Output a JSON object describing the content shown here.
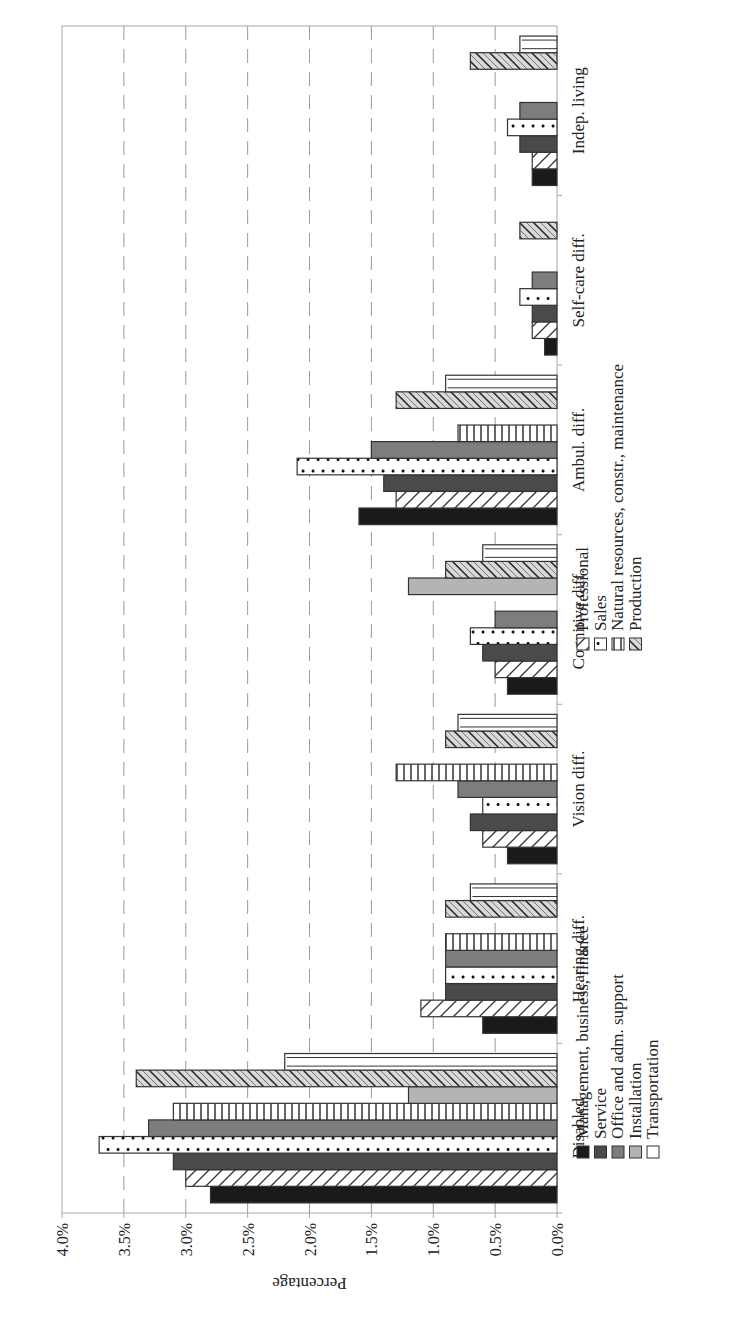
{
  "chart_data": {
    "type": "bar",
    "orientation": "vertical bars (page rotated 90° counter-clockwise)",
    "title": "",
    "xlabel": "",
    "ylabel": "Percentage",
    "ylim": [
      0,
      4.0
    ],
    "yticks": [
      "0.0%",
      "0.5%",
      "1.0%",
      "1.5%",
      "2.0%",
      "2.5%",
      "3.0%",
      "3.5%",
      "4.0%"
    ],
    "grid": "horizontal dashed at every 0.5%",
    "legend_position": "below plot, two columns",
    "categories": [
      "Disabled",
      "Hearing diff.",
      "Vision diff.",
      "Cognitive diff.",
      "Ambul. diff.",
      "Self-care diff.",
      "Indep. living"
    ],
    "series": [
      {
        "name": "Management, business, finance",
        "pattern": "solid-black",
        "values": [
          2.8,
          0.6,
          0.4,
          0.4,
          1.6,
          0.1,
          0.2
        ]
      },
      {
        "name": "Professional",
        "pattern": "diagonal-back-hatch",
        "values": [
          3.0,
          1.1,
          0.6,
          0.5,
          1.3,
          0.2,
          0.2
        ]
      },
      {
        "name": "Service",
        "pattern": "solid-dark-gray",
        "values": [
          3.1,
          0.9,
          0.7,
          0.6,
          1.4,
          0.2,
          0.3
        ]
      },
      {
        "name": "Sales",
        "pattern": "dots",
        "values": [
          3.7,
          0.9,
          0.6,
          0.7,
          2.1,
          0.3,
          0.4
        ]
      },
      {
        "name": "Office and adm. support",
        "pattern": "solid-mid-gray",
        "values": [
          3.3,
          0.9,
          0.8,
          0.5,
          1.5,
          0.2,
          0.3
        ]
      },
      {
        "name": "Natural resources, constr., maintenance",
        "pattern": "vertical-stripes",
        "values": [
          3.1,
          0.9,
          1.3,
          0,
          0.8,
          0,
          0
        ]
      },
      {
        "name": "Installation",
        "pattern": "solid-light-gray",
        "values": [
          1.2,
          0,
          0,
          1.2,
          0,
          0,
          0
        ]
      },
      {
        "name": "Production",
        "pattern": "dense-forward-hatch",
        "values": [
          3.4,
          0.9,
          0.9,
          0.9,
          1.3,
          0.3,
          0.7
        ]
      },
      {
        "name": "Transportation",
        "pattern": "white-double-line",
        "values": [
          2.2,
          0.7,
          0.8,
          0.6,
          0.9,
          0,
          0.3
        ]
      }
    ]
  },
  "legend": {
    "left_column": [
      {
        "label": "Management, business, finance",
        "series": 0
      },
      {
        "label": "Service",
        "series": 2
      },
      {
        "label": "Office and adm. support",
        "series": 4
      },
      {
        "label": "Installation",
        "series": 6
      },
      {
        "label": "Transportation",
        "series": 8
      }
    ],
    "right_column": [
      {
        "label": "Professional",
        "series": 1
      },
      {
        "label": "Sales",
        "series": 3
      },
      {
        "label": "Natural resources, constr., maintenance",
        "series": 5
      },
      {
        "label": "Production",
        "series": 7
      }
    ]
  },
  "colors": {
    "black": "#1a1a1a",
    "dark_gray": "#4a4a4a",
    "mid_gray": "#7d7d7d",
    "light_gray": "#b4b4b4",
    "outline": "#333333",
    "grid": "#9a9a9a",
    "frame": "#a8a8a8"
  }
}
